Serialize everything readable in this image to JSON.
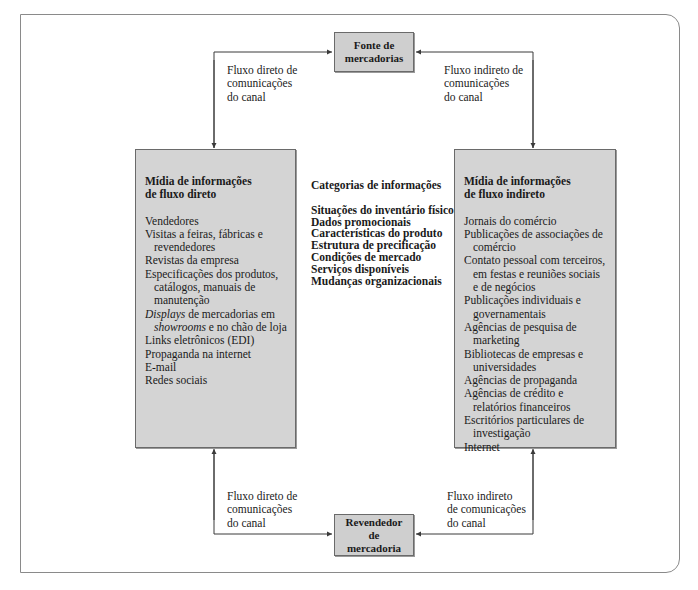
{
  "nodes": {
    "source": {
      "line1": "Fonte de",
      "line2": "mercadorias"
    },
    "reseller": {
      "line1": "Revendedor",
      "line2": "de",
      "line3": "mercadoria"
    }
  },
  "flow_labels": {
    "top_left": {
      "line1": "Fluxo direto de",
      "line2": "comunicações",
      "line3": "do canal"
    },
    "top_right": {
      "line1": "Fluxo indireto de",
      "line2": "comunicações",
      "line3": "do canal"
    },
    "bottom_left": {
      "line1": "Fluxo direto de",
      "line2": "comunicações",
      "line3": "do canal"
    },
    "bottom_right": {
      "line1": "Fluxo indireto",
      "line2": "de comunicações",
      "line3": "do canal"
    }
  },
  "direct_media": {
    "title_line1": "Mídia de informações",
    "title_line2": "de fluxo direto",
    "items": [
      "Vendedores",
      "Visitas a feiras, fábricas e revendedores",
      "Revistas da empresa",
      "Especificações dos produtos, catálogos, manuais de manutenção",
      {
        "italic1": "Displays",
        "text1": " de mercadorias em ",
        "italic2": "showrooms",
        "text2": " e no chão de loja"
      },
      "Links eletrônicos (EDI)",
      "Propaganda na internet",
      "E-mail",
      "Redes sociais"
    ]
  },
  "categories": {
    "title": "Categorias de informações",
    "items": [
      "Situações do inventário físico",
      "Dados promocionais",
      "Características do produto",
      "Estrutura de precificação",
      "Condições de mercado",
      "Serviços disponíveis",
      "Mudanças organizacionais"
    ]
  },
  "indirect_media": {
    "title_line1": "Mídia de informações",
    "title_line2": "de fluxo indireto",
    "items": [
      "Jornais do comércio",
      "Publicações de associações de comércio",
      "Contato pessoal com terceiros, em festas e reuniões sociais e de negócios",
      "Publicações individuais e governamentais",
      "Agências de pesquisa de marketing",
      "Bibliotecas de empresas e universidades",
      "Agências de propaganda",
      "Agências de crédito e relatórios financeiros",
      "Escritórios particulares de investigação",
      "Internet"
    ]
  },
  "colors": {
    "box_fill": "#d4d4d4",
    "line": "#3a3a3a",
    "frame": "#8a8a8a"
  }
}
